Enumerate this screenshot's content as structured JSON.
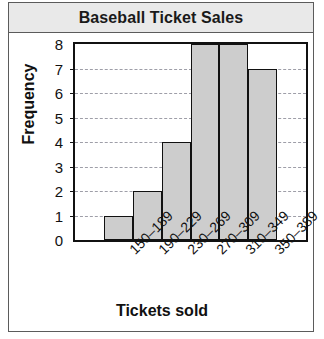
{
  "chart_data": {
    "type": "bar",
    "title": "Baseball Ticket Sales",
    "xlabel": "Tickets sold",
    "ylabel": "Frequency",
    "categories": [
      "150–189",
      "190–229",
      "230–269",
      "270–309",
      "310–349",
      "350–389"
    ],
    "values": [
      1,
      2,
      4,
      8,
      8,
      7
    ],
    "ylim": [
      0,
      8
    ],
    "yticks": [
      0,
      1,
      2,
      3,
      4,
      5,
      6,
      7,
      8
    ],
    "ytick_labels": [
      "0",
      "1",
      "2",
      "3",
      "4",
      "5",
      "6",
      "7",
      "8"
    ],
    "grid": true,
    "legend": false,
    "bar_fill_color": "#cdcdcd",
    "bar_edge_color": "#111111",
    "title_bar_color": "#e9e9e9"
  }
}
